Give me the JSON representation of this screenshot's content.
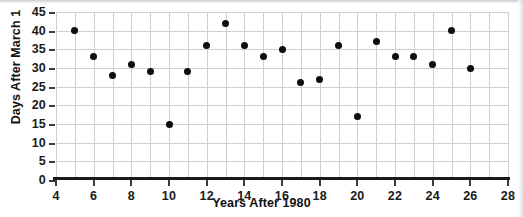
{
  "chart_data": {
    "type": "scatter",
    "title": "",
    "xlabel": "Years After 1980",
    "ylabel": "Days After March 1",
    "xlim": [
      4,
      28
    ],
    "ylim": [
      0,
      45
    ],
    "xticks": [
      4,
      6,
      8,
      10,
      12,
      14,
      16,
      18,
      20,
      22,
      24,
      26,
      28
    ],
    "yticks": [
      0,
      5,
      10,
      15,
      20,
      25,
      30,
      35,
      40,
      45
    ],
    "xtick_step_minor": 1,
    "grid": true,
    "grid_color": "#cfcfcf",
    "legend": null,
    "marker_color": "#0d0d0d",
    "x": [
      5,
      6,
      7,
      8,
      9,
      10,
      11,
      12,
      13,
      14,
      15,
      16,
      17,
      18,
      19,
      20,
      21,
      22,
      23,
      24,
      25,
      26
    ],
    "y": [
      40,
      33,
      28,
      31,
      29,
      15,
      29,
      36,
      42,
      36,
      33,
      35,
      26,
      27,
      36,
      17,
      37,
      33,
      33,
      31,
      40,
      30
    ],
    "points": [
      {
        "x": 5,
        "y": 40
      },
      {
        "x": 6,
        "y": 33
      },
      {
        "x": 7,
        "y": 28
      },
      {
        "x": 8,
        "y": 31
      },
      {
        "x": 9,
        "y": 29
      },
      {
        "x": 10,
        "y": 15
      },
      {
        "x": 11,
        "y": 29
      },
      {
        "x": 12,
        "y": 36
      },
      {
        "x": 13,
        "y": 42
      },
      {
        "x": 14,
        "y": 36
      },
      {
        "x": 15,
        "y": 33
      },
      {
        "x": 16,
        "y": 35
      },
      {
        "x": 17,
        "y": 26
      },
      {
        "x": 18,
        "y": 27
      },
      {
        "x": 19,
        "y": 36
      },
      {
        "x": 20,
        "y": 17
      },
      {
        "x": 21,
        "y": 37
      },
      {
        "x": 22,
        "y": 33
      },
      {
        "x": 23,
        "y": 33
      },
      {
        "x": 24,
        "y": 31
      },
      {
        "x": 25,
        "y": 40
      },
      {
        "x": 26,
        "y": 30
      }
    ]
  }
}
